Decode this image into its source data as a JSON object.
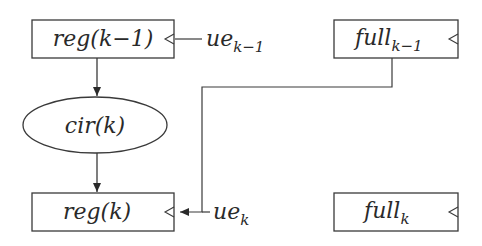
{
  "nodes": {
    "reg_prev": {
      "label": "reg(k−1)",
      "shape": "rect"
    },
    "cir": {
      "label": "cir(k)",
      "shape": "ellipse"
    },
    "reg_cur": {
      "label": "reg(k)",
      "shape": "rect"
    },
    "full_prev": {
      "base": "full",
      "sub": "k−1",
      "shape": "rect"
    },
    "full_cur": {
      "base": "full",
      "sub": "k",
      "shape": "rect"
    }
  },
  "inputs": {
    "ue_prev": {
      "base": "ue",
      "sub": "k−1"
    },
    "ue_cur": {
      "base": "ue",
      "sub": "k"
    }
  },
  "edges": [
    {
      "from": "reg(k−1)",
      "to": "cir(k)"
    },
    {
      "from": "cir(k)",
      "to": "reg(k)"
    },
    {
      "from": "full_{k−1}",
      "to": "reg(k) clock"
    },
    {
      "from": "ue_{k−1}",
      "to": "reg(k−1) clock"
    },
    {
      "from": "ue_k",
      "to": "reg(k) clock"
    }
  ],
  "colors": {
    "stroke": "#3a3a3a",
    "text": "#2a2a2a"
  }
}
